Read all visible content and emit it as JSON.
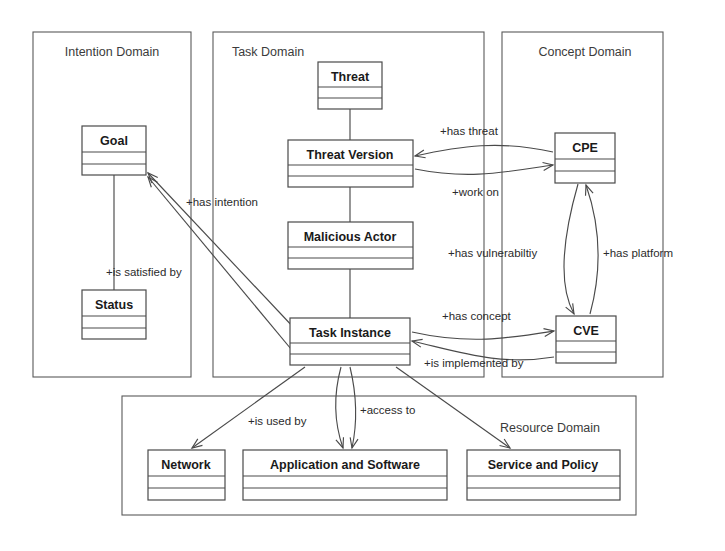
{
  "diagram": {
    "type": "uml-class-diagram",
    "domains": [
      {
        "id": "intention",
        "label": "Intention Domain",
        "x": 33,
        "y": 32,
        "width": 158,
        "height": 345
      },
      {
        "id": "task",
        "label": "Task Domain",
        "x": 213,
        "y": 32,
        "width": 271,
        "height": 345
      },
      {
        "id": "concept",
        "label": "Concept Domain",
        "x": 502,
        "y": 32,
        "width": 161,
        "height": 345
      },
      {
        "id": "resource",
        "label": "Resource Domain",
        "x": 122,
        "y": 396,
        "width": 514,
        "height": 119
      }
    ],
    "classes": [
      {
        "id": "goal",
        "name": "Goal",
        "domain": "intention",
        "x": 82,
        "y": 126,
        "width": 64,
        "height": 49
      },
      {
        "id": "status",
        "name": "Status",
        "domain": "intention",
        "x": 82,
        "y": 290,
        "width": 64,
        "height": 49
      },
      {
        "id": "threat",
        "name": "Threat",
        "domain": "task",
        "x": 318,
        "y": 62,
        "width": 64,
        "height": 47
      },
      {
        "id": "threat-version",
        "name": "Threat Version",
        "domain": "task",
        "x": 288,
        "y": 140,
        "width": 125,
        "height": 47
      },
      {
        "id": "malicious-actor",
        "name": "Malicious Actor",
        "domain": "task",
        "x": 288,
        "y": 222,
        "width": 125,
        "height": 47
      },
      {
        "id": "task-instance",
        "name": "Task Instance",
        "domain": "task",
        "x": 290,
        "y": 318,
        "width": 120,
        "height": 47
      },
      {
        "id": "cpe",
        "name": "CPE",
        "domain": "concept",
        "x": 555,
        "y": 133,
        "width": 60,
        "height": 50
      },
      {
        "id": "cve",
        "name": "CVE",
        "domain": "concept",
        "x": 556,
        "y": 316,
        "width": 60,
        "height": 47
      },
      {
        "id": "network",
        "name": "Network",
        "domain": "resource",
        "x": 148,
        "y": 450,
        "width": 77,
        "height": 50
      },
      {
        "id": "application-and-software",
        "name": "Application and Software",
        "domain": "resource",
        "x": 243,
        "y": 450,
        "width": 204,
        "height": 50
      },
      {
        "id": "service-and-policy",
        "name": "Service and Policy",
        "domain": "resource",
        "x": 467,
        "y": 450,
        "width": 153,
        "height": 50
      }
    ],
    "relationships": [
      {
        "id": "goal-status",
        "label": "",
        "from": "goal",
        "to": "status",
        "kind": "association"
      },
      {
        "id": "has-intention",
        "label": "+has intention",
        "from": "task-instance",
        "to": "goal",
        "kind": "directed",
        "label_x": 186,
        "label_y": 206
      },
      {
        "id": "is-satisfied-by",
        "label": "+is satisfied by",
        "from": "task-instance",
        "to": "goal",
        "kind": "directed",
        "label_x": 106,
        "label_y": 276
      },
      {
        "id": "threat-threatversion",
        "label": "",
        "from": "threat",
        "to": "threat-version",
        "kind": "association"
      },
      {
        "id": "threatversion-maliciousactor",
        "label": "",
        "from": "threat-version",
        "to": "malicious-actor",
        "kind": "association"
      },
      {
        "id": "maliciousactor-taskinstance",
        "label": "",
        "from": "malicious-actor",
        "to": "task-instance",
        "kind": "association"
      },
      {
        "id": "has-threat",
        "label": "+has threat",
        "from": "cpe",
        "to": "threat-version",
        "kind": "directed",
        "label_x": 440,
        "label_y": 135
      },
      {
        "id": "work-on",
        "label": "+work on",
        "from": "threat-version",
        "to": "cpe",
        "kind": "directed",
        "label_x": 452,
        "label_y": 196
      },
      {
        "id": "has-vulnerabiltiy",
        "label": "+has vulnerabiltiy",
        "from": "cpe",
        "to": "cve",
        "kind": "directed",
        "label_x": 452,
        "label_y": 257
      },
      {
        "id": "has-platform",
        "label": "+has platform",
        "from": "cve",
        "to": "cpe",
        "kind": "directed",
        "label_x": 603,
        "label_y": 257
      },
      {
        "id": "has-concept",
        "label": "+has concept",
        "from": "task-instance",
        "to": "cve",
        "kind": "directed",
        "label_x": 442,
        "label_y": 320
      },
      {
        "id": "is-implemented-by",
        "label": "+is implemented by",
        "from": "cve",
        "to": "task-instance",
        "kind": "directed",
        "label_x": 424,
        "label_y": 367
      },
      {
        "id": "is-used-by",
        "label": "+is used by",
        "from": "task-instance",
        "to": "network",
        "kind": "directed",
        "label_x": 248,
        "label_y": 425
      },
      {
        "id": "access-to",
        "label": "+access to",
        "from": "task-instance",
        "to": "application-and-software",
        "kind": "bidirectional",
        "label_x": 360,
        "label_y": 414
      },
      {
        "id": "service-policy-link",
        "label": "",
        "from": "task-instance",
        "to": "service-and-policy",
        "kind": "directed"
      }
    ],
    "colors": {
      "box_stroke": "#4a4a4a",
      "domain_stroke": "#5a5a5a",
      "text": "#1a1a1a",
      "background": "#ffffff"
    }
  }
}
